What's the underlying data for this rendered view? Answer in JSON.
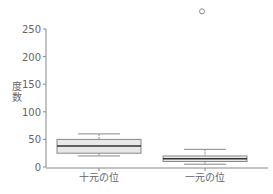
{
  "chart_data": {
    "type": "box",
    "title": "",
    "xlabel": "",
    "ylabel": "度数",
    "ylim": [
      0,
      250
    ],
    "yticks": [
      0,
      50,
      100,
      150,
      200,
      250
    ],
    "grid": false,
    "categories": [
      "十元の位",
      "一元の位"
    ],
    "series": [
      {
        "name": "十元の位",
        "whisker_low": 20,
        "q1": 25,
        "median": 38,
        "q3": 50,
        "whisker_high": 60,
        "outliers": []
      },
      {
        "name": "一元の位",
        "whisker_low": 5,
        "q1": 10,
        "median": 15,
        "q3": 20,
        "whisker_high": 32,
        "outliers": [
          282
        ]
      }
    ]
  },
  "colors": {
    "box_fill": "#e8e8e8",
    "box_stroke": "#888888",
    "median": "#333333",
    "axis": "#888888",
    "text": "#666666"
  }
}
